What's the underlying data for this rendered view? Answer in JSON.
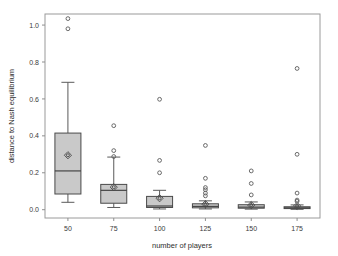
{
  "chart_data": {
    "type": "box",
    "title": "",
    "xlabel": "number of players",
    "ylabel": "distance to Nash equilibrium",
    "categories": [
      "50",
      "75",
      "100",
      "125",
      "150",
      "175"
    ],
    "xtick_labels": [
      "50",
      "75",
      "100",
      "125",
      "150",
      "175"
    ],
    "ytick_labels": [
      "0.0",
      "0.2",
      "0.4",
      "0.6",
      "0.8",
      "1.0"
    ],
    "ytick_values": [
      0.0,
      0.2,
      0.4,
      0.6,
      0.8,
      1.0
    ],
    "ylim": [
      -0.045,
      1.06
    ],
    "grid": false,
    "legend": "none",
    "marker_note": "open circle = outlier, circle-in-diamond = mean",
    "colors": {
      "box_fill": "#c9c9c9",
      "box_edge": "#4a4a4a",
      "median": "#3a3a3a",
      "whisker": "#5a5a5a",
      "outlier": "#5a5a5a",
      "frame": "#9a9a9a",
      "text": "#3b3b3b",
      "background": "#ffffff"
    },
    "boxes": [
      {
        "category": "50",
        "whisker_low": 0.04,
        "q1": 0.085,
        "median": 0.21,
        "q3": 0.415,
        "whisker_high": 0.69,
        "mean": 0.295,
        "outliers": [
          1.035,
          0.98
        ]
      },
      {
        "category": "75",
        "whisker_low": 0.012,
        "q1": 0.035,
        "median": 0.105,
        "q3": 0.137,
        "whisker_high": 0.285,
        "mean": 0.122,
        "outliers": [
          0.455,
          0.32,
          0.288
        ]
      },
      {
        "category": "100",
        "whisker_low": 0.004,
        "q1": 0.012,
        "median": 0.02,
        "q3": 0.072,
        "whisker_high": 0.105,
        "mean": 0.062,
        "outliers": [
          0.598,
          0.267,
          0.2
        ]
      },
      {
        "category": "125",
        "whisker_low": 0.004,
        "q1": 0.01,
        "median": 0.018,
        "q3": 0.032,
        "whisker_high": 0.048,
        "mean": 0.03,
        "outliers": [
          0.348,
          0.17,
          0.12,
          0.108,
          0.09,
          0.075
        ]
      },
      {
        "category": "150",
        "whisker_low": 0.003,
        "q1": 0.008,
        "median": 0.014,
        "q3": 0.027,
        "whisker_high": 0.042,
        "mean": 0.025,
        "outliers": [
          0.21,
          0.142,
          0.08
        ]
      },
      {
        "category": "175",
        "whisker_low": 0.002,
        "q1": 0.006,
        "median": 0.01,
        "q3": 0.016,
        "whisker_high": 0.026,
        "mean": 0.02,
        "outliers": [
          0.765,
          0.3,
          0.09,
          0.052,
          0.045
        ]
      }
    ]
  },
  "layout": {
    "plot_left": 45,
    "plot_right": 320,
    "plot_top": 14,
    "plot_bottom": 218,
    "box_half_width": 13
  }
}
